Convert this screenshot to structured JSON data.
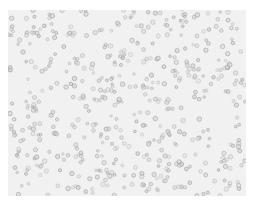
{
  "image": {
    "subject": "Brightfield micrograph of suspended round cells",
    "background_color": "#f1f1f1",
    "cell_edge_color": "#8a8a8a",
    "cell_fill_color": "#d6d6d6",
    "cell_count_approx": 520,
    "cell_radius_px": [
      1.3,
      2.3
    ],
    "empty_region": {
      "cx": 218,
      "cy": 112,
      "r": 18
    }
  }
}
